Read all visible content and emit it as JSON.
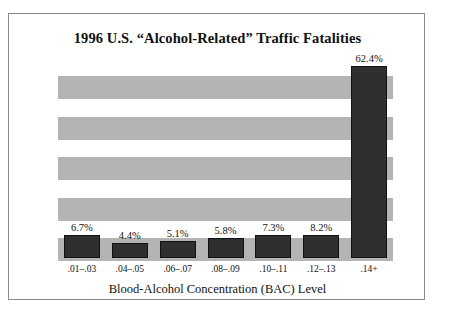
{
  "chart_data": {
    "type": "bar",
    "title": "1996 U.S. “Alcohol-Related” Traffic Fatalities",
    "xlabel": "Blood-Alcohol Concentration (BAC) Level",
    "ylabel": "",
    "categories": [
      ".01–.03",
      ".04–.05",
      ".06–.07",
      ".08–.09",
      ".10–.11",
      ".12–.13",
      ".14+"
    ],
    "values": [
      6.7,
      4.4,
      5.1,
      5.8,
      7.3,
      8.2,
      62.4
    ],
    "data_labels": [
      "6.7%",
      "4.4%",
      "5.1%",
      "5.8%",
      "7.3%",
      "8.2%",
      "62.4%"
    ],
    "ylim": [
      0,
      65
    ],
    "grid": true,
    "grid_style": "horizontal-gray-bands",
    "grid_band_count": 5,
    "legend": "none",
    "colors": {
      "bar": "#2f2f2f",
      "band": "#b4b4b4",
      "background": "#ffffff",
      "frame": "#8a8a8a",
      "text": "#111111"
    }
  }
}
